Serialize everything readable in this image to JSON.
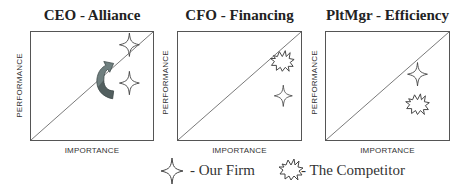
{
  "panels": [
    {
      "title": "CEO - Alliance",
      "y_axis_label": "PERFORMANCE",
      "x_axis_label": "IMPORTANCE",
      "markers": [
        {
          "type": "our-firm",
          "label": "Our Firm",
          "position": "upper-right, above diagonal"
        },
        {
          "type": "our-firm",
          "label": "Our Firm",
          "position": "right, below diagonal"
        }
      ],
      "annotation": "curved arrow indicating movement from below diagonal to above diagonal"
    },
    {
      "title": "CFO - Financing",
      "y_axis_label": "PERFORMANCE",
      "x_axis_label": "IMPORTANCE",
      "markers": [
        {
          "type": "competitor",
          "label": "The Competitor",
          "position": "upper-right, on diagonal"
        },
        {
          "type": "our-firm",
          "label": "Our Firm",
          "position": "right, below diagonal"
        }
      ]
    },
    {
      "title": "PltMgr - Efficiency",
      "y_axis_label": "PERFORMANCE",
      "x_axis_label": "IMPORTANCE",
      "markers": [
        {
          "type": "our-firm",
          "label": "Our Firm",
          "position": "right, below diagonal"
        },
        {
          "type": "competitor",
          "label": "The Competitor",
          "position": "lower-right, below diagonal"
        }
      ]
    }
  ],
  "legend": {
    "our_firm": {
      "icon": "four-point-star-icon",
      "label": "- Our Firm"
    },
    "competitor": {
      "icon": "starburst-icon",
      "label": "- The Competitor"
    }
  },
  "colors": {
    "frame": "#555555",
    "text": "#222222",
    "arrow_fill": "#6f7f7f",
    "arrow_dark": "#3f4a4a"
  }
}
